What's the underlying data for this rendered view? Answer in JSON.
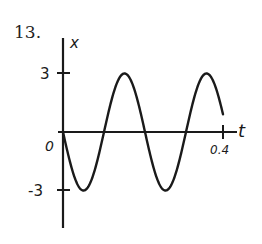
{
  "problem": {
    "number": "13."
  },
  "chart_data": {
    "type": "line",
    "title": "",
    "xlabel": "t",
    "ylabel": "x",
    "x_ticks": [
      "0",
      "0.4"
    ],
    "y_ticks": [
      "3",
      "-3"
    ],
    "xlim": [
      0,
      0.4
    ],
    "ylim": [
      -3,
      3
    ],
    "grid": false,
    "series": [
      {
        "name": "x(t)",
        "description": "sinusoid starting at 0 going negative, amplitude 3, period ~0.205",
        "x": [
          0,
          0.026,
          0.051,
          0.077,
          0.103,
          0.128,
          0.154,
          0.179,
          0.205,
          0.231,
          0.256,
          0.282,
          0.308,
          0.333,
          0.359,
          0.385,
          0.4
        ],
        "values": [
          0,
          -2.1,
          -3,
          -2.1,
          0,
          2.1,
          3,
          2.1,
          0,
          -2.1,
          -3,
          -2.1,
          0,
          2.1,
          3,
          2.1,
          0.9
        ]
      }
    ]
  }
}
